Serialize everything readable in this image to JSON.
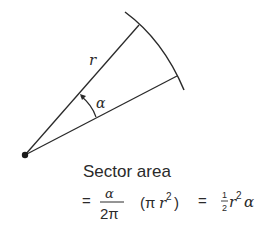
{
  "diagram": {
    "labels": {
      "radius": "r",
      "angle": "α",
      "caption": "Sector area",
      "eq1": "=",
      "frac1_num": "α",
      "frac1_den": "2π",
      "paren_expr_open": "(π",
      "paren_r": "r",
      "paren_sup": "2",
      "paren_close": ")",
      "eq2": "=",
      "frac2_num": "1",
      "frac2_den": "2",
      "tail_r": "r",
      "tail_sup": "2",
      "tail_alpha": "α"
    },
    "formula_text": "Sector area = α/(2π) (πr²) = ½r²α",
    "colors": {
      "stroke": "#2a2a2a",
      "background": "#ffffff"
    }
  }
}
